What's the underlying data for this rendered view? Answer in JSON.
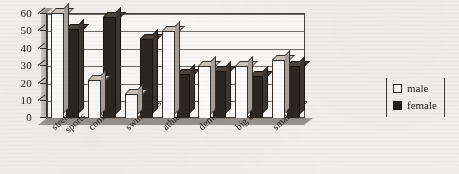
{
  "chart_data": {
    "type": "bar",
    "title": "",
    "subtitle": "",
    "xlabel": "",
    "ylabel": "",
    "categories": [
      "strength sports",
      "combat",
      "swimming",
      "athletics",
      "dem.sport",
      "big balls",
      "small balls"
    ],
    "series": [
      {
        "name": "male",
        "color": "#fdfdfb",
        "values": [
          60,
          22,
          14,
          50,
          30,
          30,
          33
        ]
      },
      {
        "name": "female",
        "color": "#2b2720",
        "values": [
          51,
          58,
          45,
          25,
          27,
          24,
          30
        ]
      }
    ],
    "ylim": [
      0,
      60
    ],
    "yticks": [
      0,
      10,
      20,
      30,
      40,
      50,
      60
    ],
    "ytick_labels": [
      "0",
      "10",
      "20",
      "30",
      "40",
      "50",
      "60"
    ],
    "grid": true,
    "grid_axis": "y",
    "legend_position": "right",
    "style": "3d-column"
  },
  "legend": {
    "items": [
      {
        "label": "male",
        "swatch": "white-square-outline"
      },
      {
        "label": "female",
        "swatch": "black-square-filled"
      }
    ]
  },
  "axis": {
    "y_tick_labels": [
      "60",
      "50",
      "40",
      "30",
      "20",
      "10",
      "0"
    ]
  },
  "x_labels": [
    {
      "line1": "strength",
      "line2": "sports"
    },
    {
      "line1": "combat",
      "line2": ""
    },
    {
      "line1": "swimming",
      "line2": ""
    },
    {
      "line1": "athletics",
      "line2": ""
    },
    {
      "line1": "dem.sport",
      "line2": ""
    },
    {
      "line1": "big balls",
      "line2": ""
    },
    {
      "line1": "small balls",
      "line2": ""
    }
  ]
}
